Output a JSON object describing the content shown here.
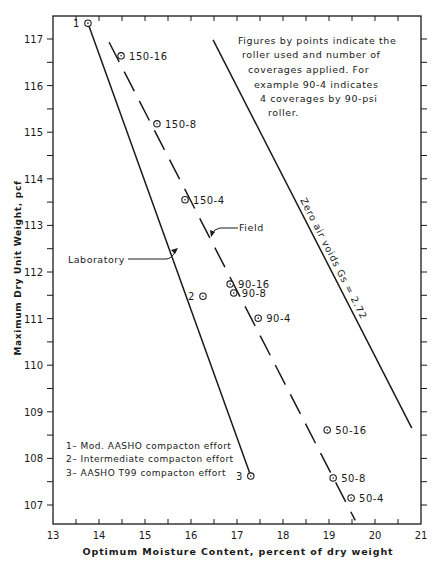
{
  "chart_data": {
    "type": "scatter",
    "title": "",
    "xlabel": "Optimum Moisture Content, percent of dry weight",
    "ylabel": "Maximum Dry Unit Weight, pcf",
    "xlim": [
      13,
      21
    ],
    "ylim": [
      106.6,
      117.5
    ],
    "xticks": [
      13,
      14,
      15,
      16,
      17,
      18,
      19,
      20,
      21
    ],
    "yticks": [
      107,
      108,
      109,
      110,
      111,
      112,
      113,
      114,
      115,
      116,
      117
    ],
    "xtick_labels": [
      "13",
      "14",
      "15",
      "16",
      "17",
      "18",
      "19",
      "20",
      "21"
    ],
    "ytick_labels": [
      "107",
      "108",
      "109",
      "110",
      "111",
      "112",
      "113",
      "114",
      "115",
      "116",
      "117"
    ],
    "grid": false,
    "laboratory_points": [
      {
        "label": "1",
        "x": 13.76,
        "y": 117.34
      },
      {
        "label": "2",
        "x": 16.26,
        "y": 111.48
      },
      {
        "label": "3",
        "x": 17.3,
        "y": 107.62
      }
    ],
    "field_points": [
      {
        "label": "150-16",
        "x": 14.48,
        "y": 116.64
      },
      {
        "label": "150-8",
        "x": 15.26,
        "y": 115.18
      },
      {
        "label": "150-4",
        "x": 15.87,
        "y": 113.55
      },
      {
        "label": "90-16",
        "x": 16.85,
        "y": 111.74
      },
      {
        "label": "90-8",
        "x": 16.93,
        "y": 111.55
      },
      {
        "label": "90-4",
        "x": 17.46,
        "y": 111.01
      },
      {
        "label": "50-16",
        "x": 18.96,
        "y": 108.61
      },
      {
        "label": "50-8",
        "x": 19.09,
        "y": 107.58
      },
      {
        "label": "50-4",
        "x": 19.48,
        "y": 107.15
      }
    ],
    "series": [
      {
        "name": "Laboratory",
        "style": "solid",
        "points": [
          [
            13.76,
            117.34
          ],
          [
            17.3,
            107.62
          ]
        ]
      },
      {
        "name": "Field",
        "style": "dashed",
        "points": [
          [
            14.22,
            116.93
          ],
          [
            19.57,
            106.67
          ]
        ]
      },
      {
        "name": "Zero air voids Gs = 2.72",
        "style": "solid",
        "points": [
          [
            16.48,
            116.98
          ],
          [
            20.8,
            108.65
          ]
        ]
      }
    ],
    "annotations": {
      "laboratory_label": "Laboratory",
      "field_label": "Field",
      "zav_label": "Zero air voids  Gs = 2.72",
      "note_lines": [
        "Figures by points indicate the",
        "roller used and number of",
        "coverages applied.  For",
        "example 90-4 indicates",
        "4 coverages by 90-psi",
        "roller."
      ],
      "legend_lines": [
        "1– Mod. AASHO compacton effort",
        "2– Intermediate compacton effort",
        "3– AASHO T99 compacton effort"
      ]
    }
  }
}
